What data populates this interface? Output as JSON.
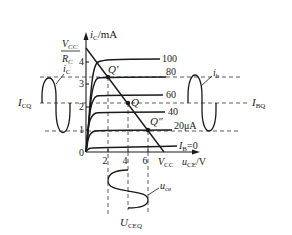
{
  "diagram": {
    "y_axis": {
      "label_var": "i",
      "label_sub": "C",
      "label_unit": "/mA",
      "ticks": [
        "0",
        "1",
        "2",
        "3",
        "4"
      ],
      "intercept_num_var": "V",
      "intercept_num_sub": "CC",
      "intercept_den_var": "R",
      "intercept_den_sub": "C"
    },
    "x_axis": {
      "label_var": "u",
      "label_sub": "CE",
      "label_unit": "/V",
      "ticks": [
        "2",
        "4",
        "6"
      ],
      "intercept_var": "V",
      "intercept_sub": "CC"
    },
    "curves": [
      {
        "label": "100"
      },
      {
        "label": "80"
      },
      {
        "label": "60"
      },
      {
        "label": "40"
      },
      {
        "label": "20μA"
      },
      {
        "label_var": "I",
        "label_sub": "B",
        "label_rest": "=0"
      }
    ],
    "points": {
      "q_prime": "Q′",
      "q": "Q",
      "q_double_prime": "Q″"
    },
    "labels": {
      "icq_var": "I",
      "icq_sub": "CQ",
      "ibq_var": "I",
      "ibq_sub": "BQ",
      "ic_var": "i",
      "ic_sub": "C",
      "ib_var": "i",
      "ib_sub": "b",
      "uce_var": "u",
      "uce_sub": "ce",
      "uceq_var": "U",
      "uceq_sub": "CEQ"
    },
    "colors": {
      "ink": "#1a1a1a",
      "background": "#ffffff"
    }
  }
}
